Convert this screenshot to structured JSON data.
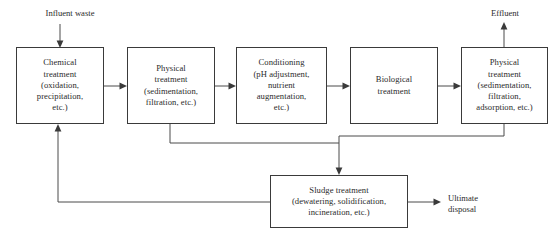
{
  "diagram": {
    "canvas": {
      "width": 560,
      "height": 244
    },
    "colors": {
      "box_stroke": "#3a3a3a",
      "line_stroke": "#4a4a4a",
      "text": "#2b2b2b",
      "background": "#ffffff"
    },
    "nodes": [
      {
        "id": "chemical-treatment",
        "label": "Chemical\ntreatment\n(oxidation,\nprecipitation,\netc.)",
        "x": 16,
        "y": 47,
        "w": 88,
        "h": 77
      },
      {
        "id": "physical-treatment-1",
        "label": "Physical\ntreatment\n(sedimentation,\nfiltration, etc.)",
        "x": 127,
        "y": 47,
        "w": 88,
        "h": 77
      },
      {
        "id": "conditioning",
        "label": "Conditioning\n(pH adjustment,\nnutrient\naugmentation,\netc.)",
        "x": 236,
        "y": 47,
        "w": 91,
        "h": 77
      },
      {
        "id": "biological-treatment",
        "label": "Biological\ntreatment",
        "x": 350,
        "y": 47,
        "w": 88,
        "h": 77
      },
      {
        "id": "physical-treatment-2",
        "label": "Physical\ntreatment\n(sedimentation,\nfiltration,\nadsorption, etc.)",
        "x": 461,
        "y": 47,
        "w": 87,
        "h": 77
      },
      {
        "id": "sludge-treatment",
        "label": "Sludge treatment\n(dewatering, solidification,\nincineration, etc.)",
        "x": 270,
        "y": 175,
        "w": 138,
        "h": 53
      }
    ],
    "io_labels": [
      {
        "id": "influent-waste",
        "text": "Influent waste",
        "x": 20,
        "y": 8,
        "w": 100
      },
      {
        "id": "effluent",
        "text": "Effluent",
        "x": 479,
        "y": 8,
        "w": 52
      },
      {
        "id": "ultimate-disposal",
        "text": "Ultimate\ndisposal",
        "x": 448,
        "y": 193,
        "w": 60
      }
    ],
    "edges": [
      {
        "id": "influent-to-chemical",
        "type": "inlet-arrow"
      },
      {
        "id": "chemical-to-physical1",
        "type": "process-arrow"
      },
      {
        "id": "physical1-to-conditioning",
        "type": "process-arrow"
      },
      {
        "id": "conditioning-to-biological",
        "type": "process-arrow"
      },
      {
        "id": "biological-to-physical2",
        "type": "process-arrow"
      },
      {
        "id": "physical2-to-effluent",
        "type": "outlet-arrow"
      },
      {
        "id": "physical1-to-sludge",
        "type": "sludge-feed"
      },
      {
        "id": "physical2-to-sludge",
        "type": "sludge-feed"
      },
      {
        "id": "sludge-to-disposal",
        "type": "outlet-arrow"
      },
      {
        "id": "sludge-recycle-to-chemical",
        "type": "recycle-return"
      }
    ]
  }
}
